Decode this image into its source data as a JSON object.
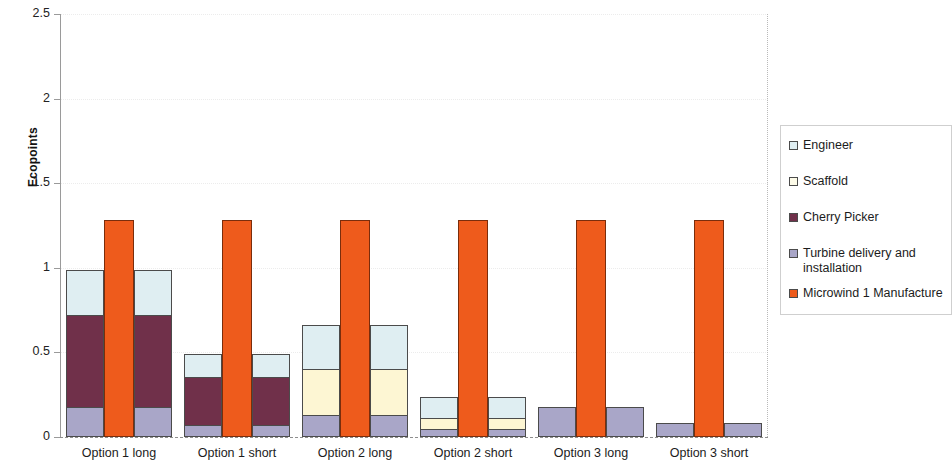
{
  "chart_data": {
    "type": "bar",
    "subtype": "stacked-bar-with-overlay-column",
    "title": "",
    "xlabel": "",
    "ylabel": "Ecopoints",
    "ylim": [
      0,
      2.5
    ],
    "ytick_labels": [
      "0",
      "0.5",
      "1",
      "1.5",
      "2",
      "2.5"
    ],
    "ytick_values": [
      0,
      0.5,
      1,
      1.5,
      2,
      2.5
    ],
    "grid": true,
    "legend_position": "right",
    "categories": [
      "Option 1 long",
      "Option 1 short",
      "Option 2 long",
      "Option 2 short",
      "Option 3 long",
      "Option 3 short"
    ],
    "series": [
      {
        "name": "Engineer",
        "color": "#dfeef2",
        "values": [
          0.265,
          0.135,
          0.265,
          0.125,
          0.0,
          0.0
        ]
      },
      {
        "name": "Scaffold",
        "color": "#fdf6d3",
        "values": [
          0.0,
          0.0,
          0.27,
          0.06,
          0.0,
          0.0
        ]
      },
      {
        "name": "Cherry Picker",
        "color": "#70304a",
        "values": [
          0.545,
          0.285,
          0.0,
          0.0,
          0.0,
          0.0
        ]
      },
      {
        "name": "Turbine delivery and installation",
        "color": "#a9a6c8",
        "values": [
          0.175,
          0.07,
          0.13,
          0.05,
          0.175,
          0.08
        ]
      },
      {
        "name": "Microwind 1 Manufacture",
        "color": "#ee5b1c",
        "values": [
          1.28,
          1.28,
          1.28,
          1.28,
          1.28,
          1.28
        ]
      }
    ],
    "stack_totals": [
      0.985,
      0.49,
      0.665,
      0.235,
      0.175,
      0.08
    ],
    "overlay_series": "Microwind 1 Manufacture",
    "overlay_value": 1.28,
    "stacked_series": [
      "Turbine delivery and installation",
      "Cherry Picker",
      "Scaffold",
      "Engineer"
    ]
  },
  "legend": {
    "items": [
      {
        "label": "Engineer",
        "color": "#dfeef2"
      },
      {
        "label": "Scaffold",
        "color": "#fdfbe8"
      },
      {
        "label": "Cherry Picker",
        "color": "#70304a"
      },
      {
        "label": "Turbine delivery and installation",
        "color": "#a9a6c8"
      },
      {
        "label": "Microwind 1 Manufacture",
        "color": "#ee5b1c"
      }
    ]
  },
  "axis": {
    "y_title": "Ecopoints"
  }
}
